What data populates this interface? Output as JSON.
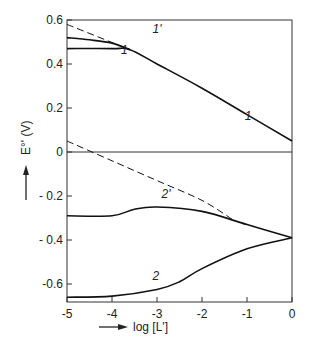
{
  "chart_data": {
    "type": "line",
    "title": "",
    "xlabel": "log [L']",
    "ylabel": "E°' (V)",
    "xlim": [
      -5,
      0
    ],
    "ylim": [
      -0.67,
      0.6
    ],
    "x_ticks": [
      -5,
      -4,
      -3,
      -2,
      -1,
      0
    ],
    "x_tick_labels": [
      "-5",
      "-4",
      "-3",
      "-2",
      "-1",
      "0"
    ],
    "y_ticks": [
      0.6,
      0.4,
      0.2,
      0,
      -0.2,
      -0.4,
      -0.6
    ],
    "y_tick_labels": [
      "0.6",
      "0.4",
      "0.2",
      "0",
      "- 0.2",
      "- 0.4",
      "-0.6"
    ],
    "grid": false,
    "zero_line": true,
    "series": [
      {
        "name": "1",
        "style": "solid",
        "x": [
          -5,
          -4,
          -3.6,
          -3,
          -2,
          -1,
          0
        ],
        "y": [
          0.47,
          0.47,
          0.465,
          0.4,
          0.29,
          0.17,
          0.05
        ]
      },
      {
        "name": "1'",
        "style": "solid",
        "x": [
          -5,
          -4.5,
          -4,
          -3.6
        ],
        "y": [
          0.52,
          0.51,
          0.495,
          0.465
        ]
      },
      {
        "name": "1' limit",
        "style": "dashed",
        "x": [
          -5,
          -3.6
        ],
        "y": [
          0.58,
          0.465
        ]
      },
      {
        "name": "2'",
        "style": "solid",
        "x": [
          -5,
          -4,
          -3.5,
          -3,
          -2,
          -1,
          0
        ],
        "y": [
          -0.29,
          -0.29,
          -0.26,
          -0.25,
          -0.27,
          -0.33,
          -0.39
        ]
      },
      {
        "name": "2' limit",
        "style": "dashed",
        "x": [
          -5,
          -4,
          -3,
          -2,
          -1.3
        ],
        "y": [
          0.05,
          -0.04,
          -0.13,
          -0.22,
          -0.31
        ]
      },
      {
        "name": "2",
        "style": "solid",
        "x": [
          -5,
          -4,
          -3,
          -2.5,
          -2,
          -1,
          0
        ],
        "y": [
          -0.66,
          -0.655,
          -0.625,
          -0.59,
          -0.53,
          -0.44,
          -0.39
        ]
      }
    ],
    "annotations": [
      {
        "text": "1'",
        "x": -3.1,
        "y": 0.54
      },
      {
        "text": "1",
        "x": -3.8,
        "y": 0.445
      },
      {
        "text": "1",
        "x": -1.05,
        "y": 0.145
      },
      {
        "text": "2'",
        "x": -2.9,
        "y": -0.21
      },
      {
        "text": "2",
        "x": -3.1,
        "y": -0.58
      }
    ]
  },
  "labels": {
    "xlabel": "log [L']",
    "ylabel": "E°' (V)"
  }
}
